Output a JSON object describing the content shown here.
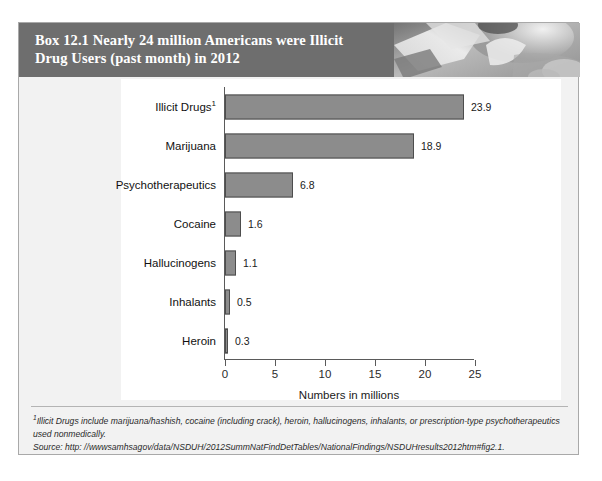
{
  "box": {
    "header_title": "Box 12.1   Nearly 24 million Americans were Illicit Drug Users (past month) in 2012",
    "header_bg": "#6e6e6e",
    "photo_name": "grayscale-abstract-photo"
  },
  "footnote": {
    "marker": "1",
    "text": "Illicit Drugs include marijuana/hashish, cocaine (including crack), heroin, hallucinogens, inhalants, or prescription-type psychotherapeutics used nonmedically.",
    "source": "Source: http: //wwwsamhsagov/data/NSDUH/2012SummNatFindDetTables/NationalFindings/NSDUHresults2012htm#fig2.1."
  },
  "chart_data": {
    "type": "bar",
    "orientation": "horizontal",
    "title": "",
    "xlabel": "Numbers in millions",
    "ylabel": "",
    "xlim": [
      0,
      25
    ],
    "xticks": [
      0,
      5,
      10,
      15,
      20,
      25
    ],
    "xtick_labels": [
      "0",
      "5",
      "10",
      "15",
      "20",
      "25"
    ],
    "grid": false,
    "legend": "none",
    "bar_color": "#8c8c8c",
    "bar_edge_color": "#4d4d4d",
    "categories": [
      "Illicit Drugs",
      "Marijuana",
      "Psychotherapeutics",
      "Cocaine",
      "Hallucinogens",
      "Inhalants",
      "Heroin"
    ],
    "category_labels": [
      "Illicit Drugs",
      "Marijuana",
      "Psychotherapeutics",
      "Cocaine",
      "Hallucinogens",
      "Inhalants",
      "Heroin"
    ],
    "category_footnote_marker": [
      "1",
      "",
      "",
      "",
      "",
      "",
      ""
    ],
    "values": [
      23.9,
      18.9,
      6.8,
      1.6,
      1.1,
      0.5,
      0.3
    ],
    "value_labels": [
      "23.9",
      "18.9",
      "6.8",
      "1.6",
      "1.1",
      "0.5",
      "0.3"
    ]
  }
}
